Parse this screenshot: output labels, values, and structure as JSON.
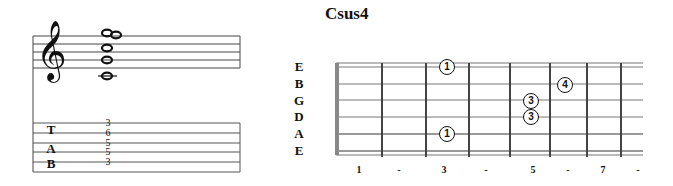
{
  "chord": {
    "name": "Csus4"
  },
  "staff": {
    "clef": "treble-clef",
    "notes": [
      "C4",
      "G4",
      "C5",
      "F5",
      "G5"
    ]
  },
  "tab": {
    "letters": [
      "T",
      "A",
      "B"
    ],
    "numbers": [
      {
        "string": 1,
        "fret": "3"
      },
      {
        "string": 2,
        "fret": "6"
      },
      {
        "string": 3,
        "fret": "5"
      },
      {
        "string": 4,
        "fret": "5"
      },
      {
        "string": 5,
        "fret": "3"
      }
    ]
  },
  "fretboard": {
    "strings": [
      "E",
      "B",
      "G",
      "D",
      "A",
      "E"
    ],
    "fret_markers": [
      "1",
      "-",
      "3",
      "-",
      "5",
      "-",
      "7",
      "-"
    ],
    "fingers": [
      {
        "string": "E (high)",
        "fret": 3,
        "finger": "1"
      },
      {
        "string": "B",
        "fret": 6,
        "finger": "4"
      },
      {
        "string": "G",
        "fret": 5,
        "finger": "3"
      },
      {
        "string": "D",
        "fret": 5,
        "finger": "3"
      },
      {
        "string": "A",
        "fret": 3,
        "finger": "1"
      }
    ]
  }
}
